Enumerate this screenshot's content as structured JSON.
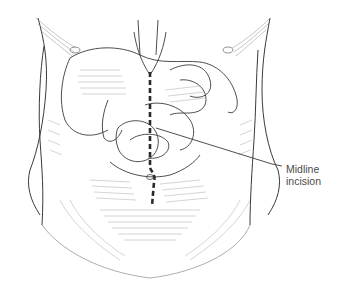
{
  "figure": {
    "callout": {
      "line1": "Midline",
      "line2": "incision"
    },
    "incision": {
      "style": "dashed",
      "color": "#2a2a2a"
    },
    "colors": {
      "line": "#3a3a3a",
      "hatch": "#9a9a9a",
      "background": "#ffffff"
    }
  }
}
